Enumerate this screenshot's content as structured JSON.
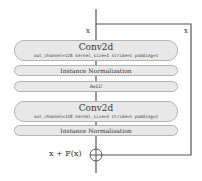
{
  "diagram": {
    "type": "residual-block",
    "input_label": "x",
    "skip_label": "x",
    "output_label": "x + F(x)",
    "blocks": [
      {
        "title": "Conv2d",
        "params": "out_channel=128 kernel_size=3 stride=1 padding=1"
      },
      {
        "title": "Instance Normalization"
      },
      {
        "title": "ReLU"
      },
      {
        "title": "Conv2d",
        "params": "out_channel=128 kernel_size=3 stride=1 padding=1"
      },
      {
        "title": "Instance Normalization"
      }
    ],
    "colors": {
      "block_fill": "#e8e8e8",
      "block_border": "#b4b4b4",
      "line": "#555555",
      "background": "#ffffff"
    }
  }
}
